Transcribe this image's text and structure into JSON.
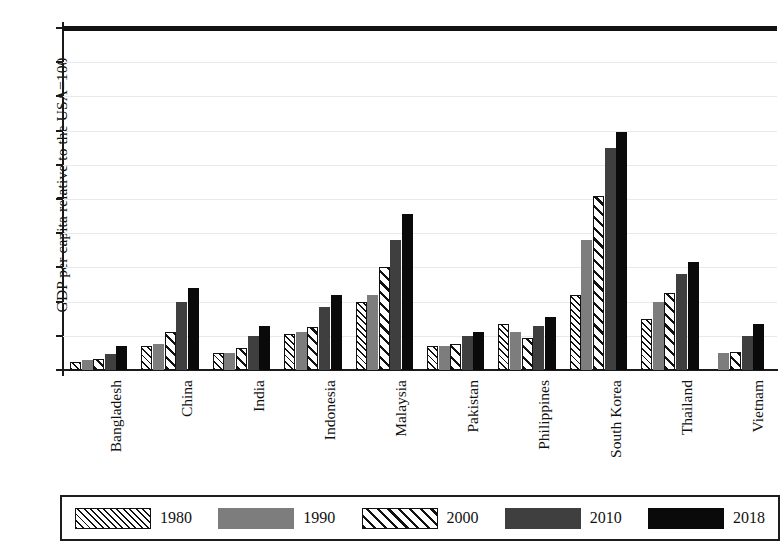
{
  "chart_data": {
    "type": "bar",
    "title": "",
    "subtitle": "",
    "xlabel": "",
    "ylabel": "GDP per capita relative to the USA=100",
    "ylim": [
      0,
      100
    ],
    "yticks": [
      0,
      10,
      20,
      30,
      40,
      50,
      60,
      70,
      80,
      90,
      100
    ],
    "ytick_labels": [
      "0",
      "10",
      "20",
      "30",
      "40",
      "50",
      "60",
      "70",
      "80",
      "90",
      "100"
    ],
    "grid": true,
    "legend_position": "bottom",
    "reference_line": {
      "value": 100,
      "label": "USA=100",
      "color": "#121212"
    },
    "categories": [
      "Bangladesh",
      "China",
      "India",
      "Indonesia",
      "Malaysia",
      "Pakistan",
      "Philippines",
      "South Korea",
      "Thailand",
      "Vietnam"
    ],
    "series": [
      {
        "name": "1980",
        "pattern": "dense-hatch",
        "color": "#ffffff",
        "values": [
          2.2,
          7.0,
          5.0,
          10.5,
          20.0,
          7.0,
          13.5,
          22.0,
          15.0,
          null
        ]
      },
      {
        "name": "1990",
        "pattern": "solid-gray",
        "color": "#7d7d7d",
        "values": [
          2.8,
          7.5,
          5.0,
          11.2,
          22.0,
          7.0,
          11.0,
          38.0,
          20.0,
          5.0
        ]
      },
      {
        "name": "2000",
        "pattern": "sparse-hatch",
        "color": "#ffffff",
        "values": [
          3.2,
          11.0,
          6.5,
          12.5,
          30.0,
          7.5,
          9.5,
          51.0,
          22.5,
          5.2
        ]
      },
      {
        "name": "2010",
        "pattern": "solid-dark-gray",
        "color": "#3f3f3f",
        "values": [
          4.6,
          20.0,
          10.0,
          18.5,
          38.0,
          10.0,
          13.0,
          65.0,
          28.0,
          10.0
        ]
      },
      {
        "name": "2018",
        "pattern": "solid-black",
        "color": "#0a0a0a",
        "values": [
          7.0,
          24.0,
          13.0,
          22.0,
          45.5,
          11.0,
          15.5,
          69.5,
          31.5,
          13.5
        ]
      }
    ]
  },
  "legend": {
    "items": [
      {
        "label": "1980",
        "pattern": "dense-hatch"
      },
      {
        "label": "1990",
        "pattern": "solid-gray"
      },
      {
        "label": "2000",
        "pattern": "sparse-hatch"
      },
      {
        "label": "2010",
        "pattern": "solid-dark-gray"
      },
      {
        "label": "2018",
        "pattern": "solid-black"
      }
    ]
  }
}
